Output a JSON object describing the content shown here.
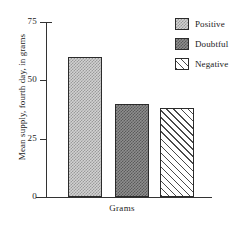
{
  "chart_data": {
    "type": "bar",
    "title": "",
    "subtitle": "",
    "xlabel": "Grams",
    "ylabel": "Mean supply, fourth day, in grams",
    "categories": [
      "Positive",
      "Doubtful",
      "Negative"
    ],
    "values": [
      60,
      40,
      38
    ],
    "series": [
      {
        "name": "Mean supply, fourth day, in grams",
        "values": [
          60,
          40,
          38
        ]
      }
    ],
    "ylim": [
      0,
      75
    ],
    "yticks": [
      0,
      25,
      50,
      75
    ],
    "ytick_labels": [
      "0",
      "25",
      "50",
      "75"
    ],
    "xticks": [],
    "grid": false,
    "legend_position": "top-right",
    "legend": [
      {
        "label": "Positive",
        "pattern": "light-checker",
        "color": "#d2d2d2"
      },
      {
        "label": "Doubtful",
        "pattern": "dark-checker",
        "color": "#8e8e8e"
      },
      {
        "label": "Negative",
        "pattern": "diagonal-hatch",
        "color": "#ffffff"
      }
    ],
    "bars": [
      {
        "label": "Positive",
        "value": 60,
        "pattern": "light-checker"
      },
      {
        "label": "Doubtful",
        "value": 40,
        "pattern": "dark-checker"
      },
      {
        "label": "Negative",
        "value": 38,
        "pattern": "diagonal-hatch"
      }
    ],
    "annotations": []
  }
}
